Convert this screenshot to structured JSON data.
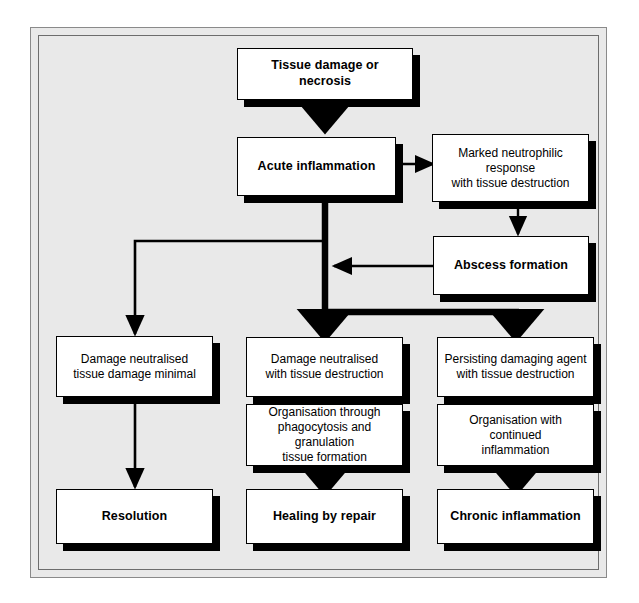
{
  "diagram": {
    "background_color": "#e9e9e9",
    "box_fill": "#ffffff",
    "line_color": "#000000",
    "shadow_color": "#000000",
    "nodes": [
      {
        "id": "tissue-damage",
        "label": "Tissue damage or necrosis",
        "style": "bold"
      },
      {
        "id": "acute-inflammation",
        "label": "Acute inflammation",
        "style": "bold"
      },
      {
        "id": "marked-neutrophilic",
        "label": "Marked neutrophilic response\nwith tissue destruction",
        "style": "plain"
      },
      {
        "id": "abscess-formation",
        "label": "Abscess formation",
        "style": "bold"
      },
      {
        "id": "damage-minimal",
        "label": "Damage neutralised\ntissue damage minimal",
        "style": "plain"
      },
      {
        "id": "damage-destruction",
        "label": "Damage neutralised\nwith tissue destruction",
        "style": "plain"
      },
      {
        "id": "persisting-agent",
        "label": "Persisting damaging agent\nwith tissue destruction",
        "style": "plain"
      },
      {
        "id": "organisation-phago",
        "label": "Organisation through\nphagocytosis and granulation\ntissue formation",
        "style": "plain"
      },
      {
        "id": "organisation-continued",
        "label": "Organisation with continued\ninflammation",
        "style": "plain"
      },
      {
        "id": "resolution",
        "label": "Resolution",
        "style": "bold"
      },
      {
        "id": "healing-by-repair",
        "label": "Healing by repair",
        "style": "bold"
      },
      {
        "id": "chronic-inflammation",
        "label": "Chronic inflammation",
        "style": "bold"
      }
    ],
    "edges": [
      {
        "from": "tissue-damage",
        "to": "acute-inflammation",
        "weight": "thick"
      },
      {
        "from": "acute-inflammation",
        "to": "marked-neutrophilic",
        "weight": "thin"
      },
      {
        "from": "marked-neutrophilic",
        "to": "abscess-formation",
        "weight": "thin"
      },
      {
        "from": "abscess-formation",
        "to": "acute-inflammation",
        "weight": "thin"
      },
      {
        "from": "acute-inflammation",
        "to": "damage-minimal",
        "weight": "thin"
      },
      {
        "from": "acute-inflammation",
        "to": "damage-destruction",
        "weight": "thick"
      },
      {
        "from": "acute-inflammation",
        "to": "persisting-agent",
        "weight": "thick"
      },
      {
        "from": "damage-minimal",
        "to": "resolution",
        "weight": "thin"
      },
      {
        "from": "organisation-phago",
        "to": "healing-by-repair",
        "weight": "thick"
      },
      {
        "from": "organisation-continued",
        "to": "chronic-inflammation",
        "weight": "thick"
      }
    ]
  }
}
